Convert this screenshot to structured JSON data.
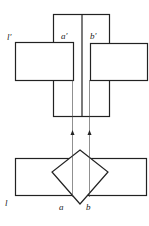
{
  "diagram": {
    "labels": {
      "l_prime": "l′",
      "a_prime": "a′",
      "b_prime": "b′",
      "l": "l",
      "a": "a",
      "b": "b"
    },
    "stroke_color": "#222222"
  }
}
